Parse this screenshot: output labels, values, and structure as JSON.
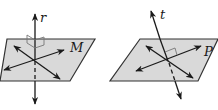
{
  "figures": [
    {
      "id": "left",
      "plane_label": "M",
      "line_label": "r",
      "description": "Line r perpendicular to plane M; two lines in M pass through the intersection point, each marked with a right angle to r"
    },
    {
      "id": "right",
      "plane_label": "P",
      "line_label": "t",
      "description": "Line t intersects plane P; a right-angle mark appears at only one of the two lines in P"
    }
  ],
  "colors": {
    "plane_fill": "#d9d9d9",
    "plane_edge": "#333333",
    "line": "#1a1a1a",
    "right_angle_mark": "#777777"
  }
}
